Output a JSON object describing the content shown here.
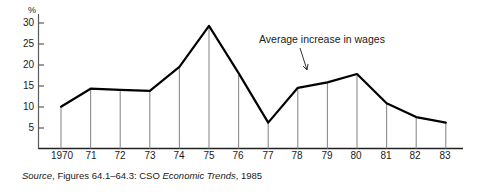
{
  "chart_data": {
    "type": "area",
    "title": "",
    "subtitle": "",
    "xlabel": "",
    "ylabel": "%",
    "ylim": [
      0,
      32
    ],
    "yticks": [
      5,
      10,
      15,
      20,
      25,
      30
    ],
    "ytick_labels": [
      "5",
      "10",
      "15",
      "20",
      "25",
      "30"
    ],
    "grid": false,
    "legend_position": "none",
    "categories": [
      "1970",
      "71",
      "72",
      "73",
      "74",
      "75",
      "76",
      "77",
      "78",
      "79",
      "80",
      "81",
      "82",
      "83"
    ],
    "x": [
      1970,
      1971,
      1972,
      1973,
      1974,
      1975,
      1976,
      1977,
      1978,
      1979,
      1980,
      1981,
      1982,
      1983
    ],
    "series": [
      {
        "name": "Average increase in wages",
        "values": [
          10.0,
          14.3,
          14.0,
          13.8,
          19.5,
          29.3,
          18.0,
          6.2,
          14.5,
          15.8,
          17.8,
          10.8,
          7.5,
          6.2
        ]
      }
    ],
    "annotations": [
      {
        "text": "Average increase in wages",
        "points_to_year": 1980,
        "points_to_value": 17.8
      }
    ]
  },
  "axis": {
    "y_unit_label": "%",
    "ytick_labels": [
      "30",
      "25",
      "20",
      "15",
      "10",
      "5"
    ],
    "xtick_labels": [
      "1970",
      "71",
      "72",
      "73",
      "74",
      "75",
      "76",
      "77",
      "78",
      "79",
      "80",
      "81",
      "82",
      "83"
    ]
  },
  "annotation": {
    "label": "Average increase in wages"
  },
  "source": {
    "prefix": "Source",
    "body": ", Figures 64.1–64.3: CSO ",
    "publication": "Economic Trends",
    "suffix": ", 1985"
  },
  "colors": {
    "line": "#000000",
    "axis": "#4d4d4d",
    "stem": "#8c8c8c",
    "text": "#1a1a1a",
    "background": "#ffffff"
  }
}
